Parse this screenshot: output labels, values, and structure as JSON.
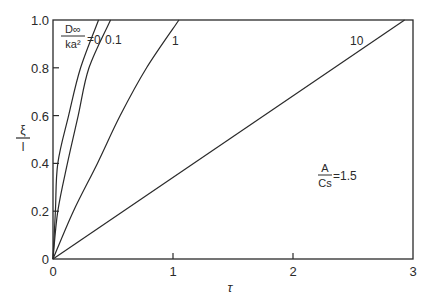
{
  "chart_data": {
    "type": "line",
    "title": "",
    "xlabel": "τ",
    "ylabel": "ξ/l",
    "ylabel_parts": {
      "numerator": "ξ",
      "denominator": "l"
    },
    "xlim": [
      0,
      3
    ],
    "ylim": [
      0,
      1.0
    ],
    "grid": false,
    "x_ticks": [
      0,
      1,
      2,
      3
    ],
    "x_tick_labels": [
      "0",
      "1",
      "2",
      "3"
    ],
    "y_ticks": [
      0,
      0.2,
      0.4,
      0.6,
      0.8,
      1.0
    ],
    "y_tick_labels": [
      "0",
      "0.2",
      "0.4",
      "0.6",
      "0.8",
      "1.0"
    ],
    "parameter_label": {
      "numerator": "D∞",
      "denominator": "ka²",
      "equals": "="
    },
    "annotation": {
      "numerator": "A",
      "denominator": "Cs",
      "value": "=1.5"
    },
    "series": [
      {
        "name": "0",
        "label": "0",
        "x": [
          0,
          0.02,
          0.04,
          0.13,
          0.23,
          0.38
        ],
        "y": [
          0,
          0.2,
          0.4,
          0.6,
          0.8,
          1.0
        ]
      },
      {
        "name": "0.1",
        "label": "0.1",
        "x": [
          0,
          0.04,
          0.12,
          0.21,
          0.3,
          0.48
        ],
        "y": [
          0,
          0.2,
          0.4,
          0.6,
          0.8,
          1.0
        ]
      },
      {
        "name": "1",
        "label": "1",
        "x": [
          0,
          0.17,
          0.37,
          0.56,
          0.78,
          1.05
        ],
        "y": [
          0,
          0.2,
          0.4,
          0.6,
          0.8,
          1.0
        ]
      },
      {
        "name": "10",
        "label": "10",
        "x": [
          0,
          2.93
        ],
        "y": [
          0,
          1.0
        ]
      }
    ]
  }
}
